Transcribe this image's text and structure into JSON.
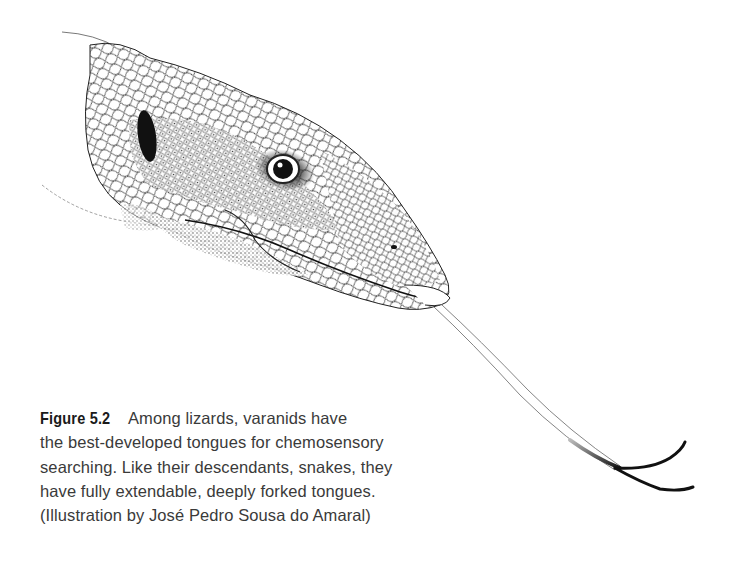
{
  "figure": {
    "illustration": {
      "subject": "varanid-lizard-head-with-forked-tongue",
      "colors": {
        "ink": "#1a1a1a",
        "background": "#ffffff"
      }
    },
    "caption": {
      "label": "Figure 5.2",
      "lines": [
        "Among lizards, varanids have",
        "the best-developed tongues for chemosensory",
        "searching. Like their descendants, snakes, they",
        "have fully extendable, deeply forked tongues.",
        "(Illustration by José Pedro Sousa do Amaral)"
      ]
    }
  }
}
